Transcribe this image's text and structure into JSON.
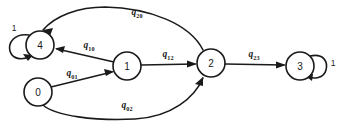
{
  "diagram": {
    "type": "state-transition-graph",
    "background_color": "#ffffff",
    "stroke_color": "#1a1a1a",
    "width": 339,
    "height": 125,
    "nodes": [
      {
        "id": "0",
        "label": "0",
        "cx": 38,
        "cy": 92,
        "r": 14
      },
      {
        "id": "1",
        "label": "1",
        "cx": 127,
        "cy": 66,
        "r": 14
      },
      {
        "id": "2",
        "label": "2",
        "cx": 211,
        "cy": 63,
        "r": 14
      },
      {
        "id": "3",
        "label": "3",
        "cx": 300,
        "cy": 66,
        "r": 14
      },
      {
        "id": "4",
        "label": "4",
        "cx": 40,
        "cy": 45,
        "r": 14
      }
    ],
    "edges": [
      {
        "id": "q01",
        "from": "0",
        "to": "1",
        "base": "q",
        "sub": "01",
        "label": "q01",
        "label_x": 72,
        "label_y": 73
      },
      {
        "id": "q10",
        "from": "1",
        "to": "4",
        "base": "q",
        "sub": "10",
        "label": "q10",
        "label_x": 89,
        "label_y": 45
      },
      {
        "id": "q12",
        "from": "1",
        "to": "2",
        "base": "q",
        "sub": "12",
        "label": "q12",
        "label_x": 168,
        "label_y": 54
      },
      {
        "id": "q23",
        "from": "2",
        "to": "3",
        "base": "q",
        "sub": "23",
        "label": "q23",
        "label_x": 254,
        "label_y": 54
      },
      {
        "id": "q20",
        "from": "2",
        "to": "4",
        "base": "q",
        "sub": "20",
        "label": "q20",
        "label_x": 137,
        "label_y": 12
      },
      {
        "id": "q02",
        "from": "0",
        "to": "2",
        "base": "q",
        "sub": "02",
        "label": "q02",
        "label_x": 127,
        "label_y": 105
      }
    ],
    "self_loops": [
      {
        "id": "loop4",
        "node": "4",
        "label": "1",
        "side": "left",
        "label_x": 14,
        "label_y": 28
      },
      {
        "id": "loop3",
        "node": "3",
        "label": "1",
        "side": "right",
        "label_x": 333,
        "label_y": 63
      }
    ]
  }
}
